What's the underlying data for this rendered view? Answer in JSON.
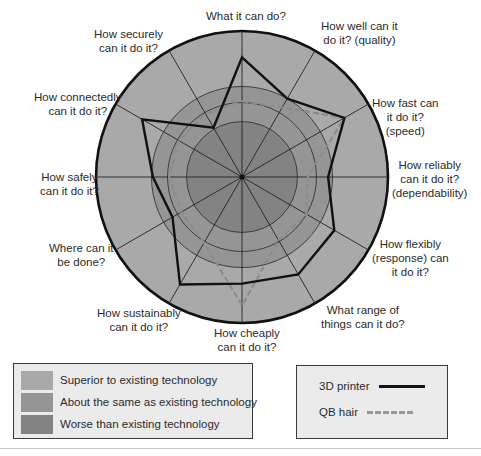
{
  "chart_data": {
    "type": "radar",
    "title": "",
    "axes": [
      "What it can do?",
      "How well can it do it? (quality)",
      "How fast can it do it? (speed)",
      "How reliably can it do it? (dependability)",
      "How flexibly (response) can it do it?",
      "What range of things can it do?",
      "How cheaply can it do it?",
      "How sustainably can it do it?",
      "Where can it be done?",
      "How safely can it do it?",
      "How connectedly can it do it?",
      "How securely can it do it?"
    ],
    "scale_note": "radius as fraction of outer circle (0 = centre, 1 = rim)",
    "bands": [
      {
        "name": "Worse than existing technology",
        "from": 0.0,
        "to": 0.38,
        "color": "#838383"
      },
      {
        "name": "About the same as existing technology",
        "from": 0.38,
        "to": 0.62,
        "color": "#959595"
      },
      {
        "name": "Superior to existing technology",
        "from": 0.62,
        "to": 1.0,
        "color": "#a9a9a9"
      }
    ],
    "grid_circles": [
      0.38,
      0.51,
      0.62,
      1.0
    ],
    "series": [
      {
        "name": "3D printer",
        "style": "solid",
        "color": "#111111",
        "values": [
          0.82,
          0.62,
          0.81,
          0.59,
          0.73,
          0.77,
          0.73,
          0.85,
          0.55,
          0.61,
          0.79,
          0.39
        ]
      },
      {
        "name": "QB hair",
        "style": "dashed",
        "color": "#8c8c8c",
        "values": [
          0.52,
          0.55,
          0.81,
          0.45,
          0.51,
          0.5,
          0.88,
          0.52,
          0.48,
          0.5,
          0.5,
          0.5
        ]
      }
    ],
    "legend_position": "bottom"
  },
  "labels": {
    "axis": [
      [
        "What it can do?"
      ],
      [
        "How well can it",
        "do it? (quality)"
      ],
      [
        "How fast can",
        "it do it?",
        "(speed)"
      ],
      [
        "How reliably",
        "can it do it?",
        "(dependability)"
      ],
      [
        "How flexibly",
        "(response) can",
        "it do it?"
      ],
      [
        "What range of",
        "things can it do?"
      ],
      [
        "How cheaply",
        "can it do it?"
      ],
      [
        "How sustainably",
        "can it do it?"
      ],
      [
        "Where can it",
        "be done?"
      ],
      [
        "How safely",
        "can it do it?"
      ],
      [
        "How connectedly",
        "can it do it?"
      ],
      [
        "How securely",
        "can it do it?"
      ]
    ]
  },
  "legend_bands": {
    "items": [
      {
        "label": "Superior to existing technology",
        "color": "#a9a9a9"
      },
      {
        "label": "About the same as existing technology",
        "color": "#959595"
      },
      {
        "label": "Worse than existing technology",
        "color": "#838383"
      }
    ]
  },
  "legend_series": {
    "items": [
      {
        "label": "3D printer",
        "style": "solid",
        "color": "#111111"
      },
      {
        "label": "QB hair",
        "style": "dashed",
        "color": "#9a9a9a"
      }
    ]
  }
}
